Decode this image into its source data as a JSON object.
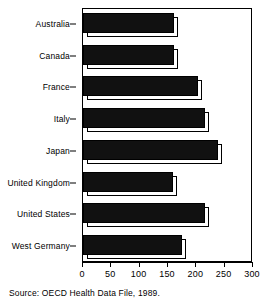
{
  "chart_data": {
    "type": "bar",
    "orientation": "horizontal",
    "title": "",
    "xlabel": "",
    "ylabel": "",
    "xlim": [
      0,
      300
    ],
    "xticks": [
      0,
      50,
      100,
      150,
      200,
      250,
      300
    ],
    "grid": false,
    "legend": null,
    "categories": [
      "Australia",
      "Canada",
      "France",
      "Italy",
      "Japan",
      "United Kingdom",
      "United States",
      "West Germany"
    ],
    "values": [
      160,
      160,
      203,
      215,
      238,
      159,
      215,
      175
    ],
    "bar_color": "#111111",
    "bar_style": "3d-extruded",
    "source": "Source: OECD Health Data File, 1989."
  },
  "footer": {
    "source_text": "Source: OECD Health Data File, 1989."
  }
}
